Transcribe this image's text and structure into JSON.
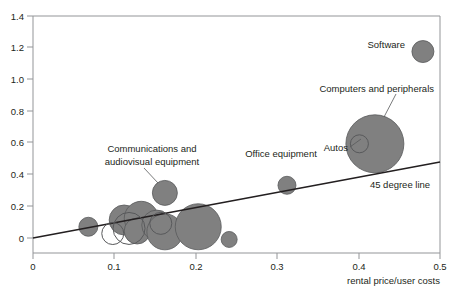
{
  "chart_data": {
    "type": "scatter",
    "title": "",
    "subtitle": "",
    "xlabel": "rental price/user costs",
    "ylabel": "",
    "xlim": [
      0,
      0.5
    ],
    "ylim": [
      0,
      1.4
    ],
    "grid": false,
    "legend_position": "none",
    "x_ticks": [
      "0",
      "0.1",
      "0.2",
      "0.3",
      "0.4",
      "0.5"
    ],
    "x_tick_values": [
      0,
      0.1,
      0.2,
      0.3,
      0.4,
      0.5
    ],
    "y_ticks": [
      "0",
      "0.2",
      "0.4",
      "0.6",
      "0.8",
      "1.0",
      "1.2",
      "1.4"
    ],
    "y_tick_values": [
      0,
      0.2,
      0.4,
      0.6,
      0.8,
      1.0,
      1.2,
      1.4
    ],
    "marker_style": "bubble",
    "bubble_fill": "#808080",
    "bubble_stroke": "#58595b",
    "reference_line": {
      "label": "45 degree line",
      "type": "line",
      "from": [
        0,
        0
      ],
      "to": [
        0.5,
        0.5
      ],
      "note": "drawn from origin rising to the right edge",
      "color": "#231f20"
    },
    "points": [
      {
        "name": "Software",
        "x": 0.479,
        "y": 1.19,
        "size": 11,
        "labeled": true,
        "open": false
      },
      {
        "name": "Computers and peripherals",
        "x": 0.42,
        "y": 0.645,
        "size": 29,
        "labeled": true,
        "open": false
      },
      {
        "name": "Autos",
        "x": 0.401,
        "y": 0.645,
        "size": 9,
        "labeled": true,
        "open": true
      },
      {
        "name": "Office equipment",
        "x": 0.312,
        "y": 0.4,
        "size": 9,
        "labeled": true,
        "open": false
      },
      {
        "name": "Communications and audiovisual equipment",
        "x": 0.162,
        "y": 0.355,
        "size": 12.5,
        "labeled": true,
        "open": false
      },
      {
        "name": "unlabeled-1",
        "x": 0.068,
        "y": 0.155,
        "size": 9.5,
        "labeled": false,
        "open": false
      },
      {
        "name": "unlabeled-2",
        "x": 0.098,
        "y": 0.115,
        "size": 11,
        "labeled": false,
        "open": true
      },
      {
        "name": "unlabeled-3",
        "x": 0.112,
        "y": 0.195,
        "size": 15,
        "labeled": false,
        "open": false
      },
      {
        "name": "unlabeled-4",
        "x": 0.118,
        "y": 0.145,
        "size": 16,
        "labeled": false,
        "open": true
      },
      {
        "name": "unlabeled-5",
        "x": 0.133,
        "y": 0.205,
        "size": 17,
        "labeled": false,
        "open": false
      },
      {
        "name": "unlabeled-6",
        "x": 0.128,
        "y": 0.13,
        "size": 13,
        "labeled": false,
        "open": false
      },
      {
        "name": "unlabeled-7",
        "x": 0.152,
        "y": 0.165,
        "size": 15,
        "labeled": false,
        "open": false
      },
      {
        "name": "unlabeled-8",
        "x": 0.157,
        "y": 0.175,
        "size": 11,
        "labeled": false,
        "open": true
      },
      {
        "name": "unlabeled-9",
        "x": 0.162,
        "y": 0.125,
        "size": 18,
        "labeled": false,
        "open": false
      },
      {
        "name": "unlabeled-10",
        "x": 0.203,
        "y": 0.155,
        "size": 23,
        "labeled": false,
        "open": false
      },
      {
        "name": "unlabeled-11",
        "x": 0.241,
        "y": 0.08,
        "size": 8,
        "labeled": false,
        "open": false
      }
    ],
    "annotations": [
      {
        "text": "Software",
        "x": 0.44,
        "y": 1.215,
        "anchor": "end"
      },
      {
        "text": "Computers and peripherals",
        "x": 0.425,
        "y": 0.885,
        "anchor": "end"
      },
      {
        "text": "Autos",
        "x": 0.385,
        "y": 0.565,
        "anchor": "end"
      },
      {
        "text": "Office equipment",
        "x": 0.305,
        "y": 0.51,
        "anchor": "middle"
      },
      {
        "text": "Communications and",
        "x": 0.147,
        "y": 0.595,
        "anchor": "middle"
      },
      {
        "text": "audiovisual equipment",
        "x": 0.147,
        "y": 0.515,
        "anchor": "middle"
      },
      {
        "text": "45 degree line",
        "x": 0.42,
        "y": 0.275,
        "anchor": "middle"
      }
    ]
  },
  "axes": {
    "x_title": "rental price/user costs",
    "x_tick_labels": [
      "0",
      "0.1",
      "0.2",
      "0.3",
      "0.4",
      "0.5"
    ],
    "y_tick_labels": [
      "1.4",
      "1.2",
      "1.0",
      "0.8",
      "0.6",
      "0.4",
      "0.2",
      "0"
    ]
  },
  "labels": {
    "software": "Software",
    "computers": "Computers and peripherals",
    "autos": "Autos",
    "office": "Office equipment",
    "comms_line1": "Communications and",
    "comms_line2": "audiovisual equipment",
    "reference": "45 degree line"
  }
}
